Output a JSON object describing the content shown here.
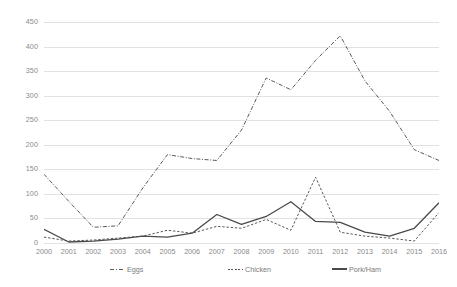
{
  "chart_data": {
    "type": "line",
    "title": "",
    "subtitle": "",
    "xlabel": "",
    "ylabel": "",
    "x": [
      2000,
      2001,
      2002,
      2003,
      2004,
      2005,
      2006,
      2007,
      2008,
      2009,
      2010,
      2011,
      2012,
      2013,
      2014,
      2015,
      2016
    ],
    "categories": [
      "2000",
      "2001",
      "2002",
      "2003",
      "2004",
      "2005",
      "2006",
      "2007",
      "2008",
      "2009",
      "2010",
      "2011",
      "2012",
      "2013",
      "2014",
      "2015",
      "2016"
    ],
    "ylim": [
      0,
      450
    ],
    "xlim": [
      2000,
      2016
    ],
    "yticks": [
      0,
      50,
      100,
      150,
      200,
      250,
      300,
      350,
      400,
      450
    ],
    "ytick_labels": [
      "0",
      "50",
      "100",
      "150",
      "200",
      "250",
      "300",
      "350",
      "400",
      "450"
    ],
    "grid": true,
    "grid_axis": "y",
    "legend_position": "bottom",
    "series": [
      {
        "name": "Eggs",
        "style": "dash-dot",
        "color": "#595959",
        "values": [
          140,
          85,
          32,
          35,
          112,
          180,
          172,
          168,
          230,
          336,
          312,
          372,
          422,
          330,
          268,
          190,
          168
        ]
      },
      {
        "name": "Chicken",
        "style": "dashed",
        "color": "#595959",
        "values": [
          12,
          4,
          6,
          10,
          14,
          26,
          20,
          34,
          30,
          48,
          26,
          134,
          22,
          14,
          10,
          4,
          62
        ]
      },
      {
        "name": "Pork/Ham",
        "style": "solid",
        "color": "#4a4a4a",
        "values": [
          28,
          2,
          4,
          8,
          14,
          12,
          20,
          58,
          38,
          54,
          84,
          44,
          42,
          22,
          14,
          30,
          82
        ]
      }
    ]
  },
  "legend": {
    "items": [
      {
        "label": "Eggs",
        "style": "dash-dot"
      },
      {
        "label": "Chicken",
        "style": "dashed"
      },
      {
        "label": "Pork/Ham",
        "style": "solid"
      }
    ]
  },
  "colors": {
    "grid": "#e2e2e2",
    "tick_text": "#8a8a8a",
    "legend_text": "#7a7a7a",
    "background": "#ffffff"
  }
}
